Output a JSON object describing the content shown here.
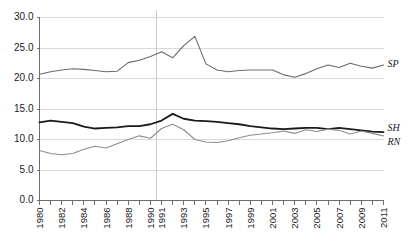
{
  "chart_data": {
    "type": "line",
    "title": "",
    "subtitle": "",
    "xlabel": "",
    "ylabel": "",
    "grid": true,
    "legend_position": "right-inline",
    "ylim": [
      0.0,
      30.0
    ],
    "yticks": [
      "0.0",
      "5.0",
      "10.0",
      "15.0",
      "20.0",
      "25.0",
      "30.0"
    ],
    "ytick_values": [
      0.0,
      5.0,
      10.0,
      15.0,
      20.0,
      25.0,
      30.0
    ],
    "categories": [
      "1980",
      "1981",
      "1982",
      "1983",
      "1984",
      "1985",
      "1986",
      "1987",
      "1988",
      "1989",
      "1990",
      "1991",
      "1992",
      "1993",
      "1994",
      "1995",
      "1996",
      "1997",
      "1998",
      "1999",
      "2000",
      "2001",
      "2002",
      "2003",
      "2004",
      "2005",
      "2006",
      "2007",
      "2008",
      "2009",
      "2010",
      "2011"
    ],
    "xtick_labels_shown": [
      "1980",
      "1982",
      "1984",
      "1986",
      "1988",
      "1990",
      "1991",
      "1993",
      "1995",
      "1997",
      "1999",
      "2001",
      "2003",
      "2005",
      "2007",
      "2009",
      "2011"
    ],
    "divider_after_category": "1990",
    "series": [
      {
        "name": "SP",
        "label": "SP",
        "color": "#6b6b6b",
        "width": 1.1,
        "values": [
          20.7,
          21.1,
          21.4,
          21.6,
          21.5,
          21.3,
          21.1,
          21.2,
          22.6,
          23.0,
          23.6,
          24.4,
          23.4,
          25.4,
          26.9,
          22.4,
          21.4,
          21.1,
          21.3,
          21.4,
          21.4,
          21.4,
          20.6,
          20.2,
          20.8,
          21.6,
          22.2,
          21.8,
          22.5,
          22.0,
          21.7,
          22.2
        ]
      },
      {
        "name": "SH",
        "label": "SH",
        "color": "#1a1a1a",
        "width": 1.8,
        "values": [
          12.8,
          13.1,
          12.9,
          12.7,
          12.1,
          11.8,
          11.9,
          12.0,
          12.2,
          12.2,
          12.5,
          13.1,
          14.2,
          13.4,
          13.1,
          13.0,
          12.9,
          12.7,
          12.5,
          12.2,
          12.0,
          11.8,
          11.7,
          11.8,
          11.9,
          11.9,
          11.7,
          11.9,
          11.7,
          11.5,
          11.3,
          11.2
        ]
      },
      {
        "name": "RN",
        "label": "RN",
        "color": "#8c8c8c",
        "width": 1.1,
        "values": [
          8.2,
          7.7,
          7.5,
          7.7,
          8.4,
          8.9,
          8.6,
          9.3,
          10.0,
          10.6,
          10.2,
          11.8,
          12.5,
          11.6,
          10.0,
          9.6,
          9.5,
          9.8,
          10.3,
          10.7,
          10.9,
          11.1,
          11.4,
          11.0,
          11.6,
          11.3,
          11.7,
          11.5,
          10.9,
          11.4,
          11.0,
          10.6
        ]
      }
    ]
  },
  "series_labels": {
    "sp": "SP",
    "sh": "SH",
    "rn": "RN"
  }
}
